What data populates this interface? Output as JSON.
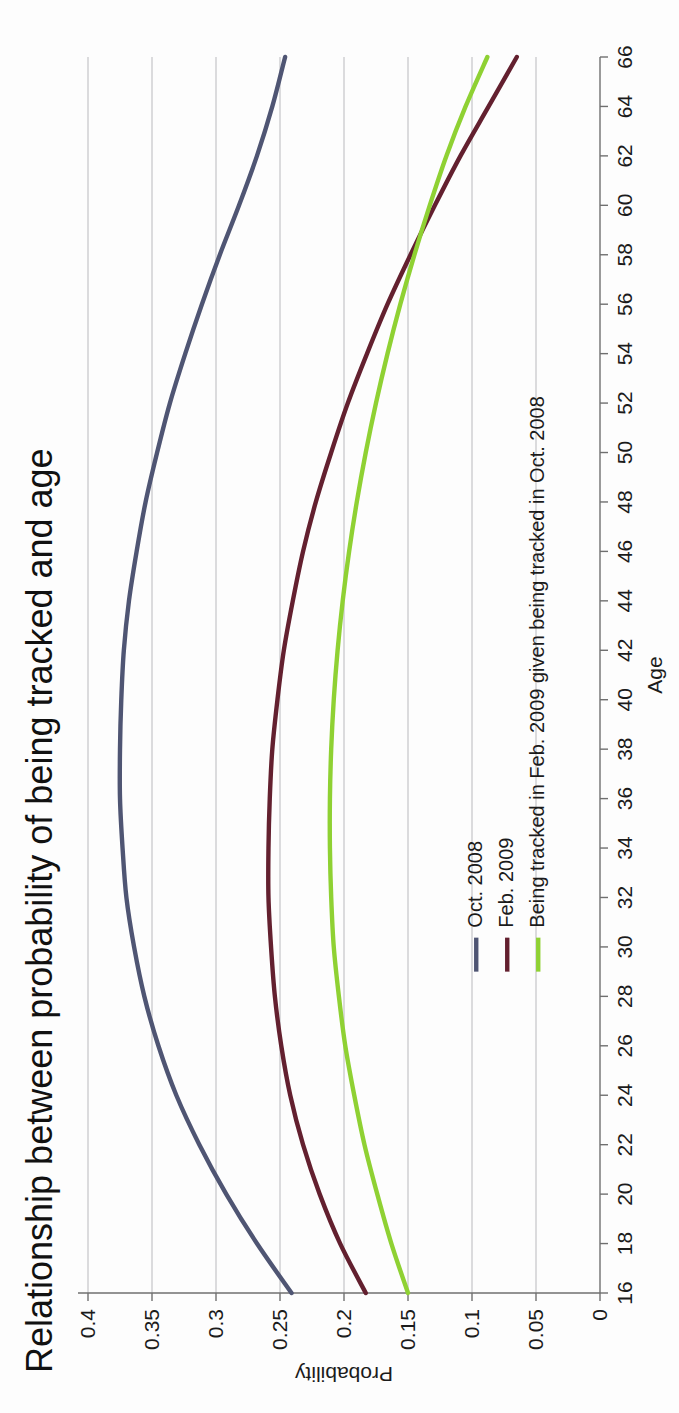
{
  "document": {
    "kind": "scanned-chart-page",
    "orientation": "rotated-90-ccw"
  },
  "chart_data": {
    "type": "line",
    "title": "Relationship between probability of being tracked and age",
    "xlabel": "Age",
    "ylabel": "Probability",
    "xlim": [
      16,
      66
    ],
    "ylim": [
      0,
      0.4
    ],
    "grid": true,
    "legend_position": "inside-left",
    "x_ticks": [
      16,
      18,
      20,
      22,
      24,
      26,
      28,
      30,
      32,
      34,
      36,
      38,
      40,
      42,
      44,
      46,
      48,
      50,
      52,
      54,
      56,
      58,
      60,
      62,
      64,
      66
    ],
    "y_ticks": [
      0,
      0.05,
      0.1,
      0.15,
      0.2,
      0.25,
      0.3,
      0.35,
      0.4
    ],
    "y_tick_labels": [
      "0",
      "0.05",
      "0.1",
      "0.15",
      "0.2",
      "0.25",
      "0.3",
      "0.35",
      "0.4"
    ],
    "x": [
      16,
      18,
      20,
      22,
      24,
      26,
      28,
      30,
      32,
      34,
      36,
      38,
      40,
      42,
      44,
      46,
      48,
      50,
      52,
      54,
      56,
      58,
      60,
      62,
      64,
      66
    ],
    "series": [
      {
        "name": "Oct. 2008",
        "color": "#4f5573",
        "values": [
          0.241,
          0.268,
          0.292,
          0.313,
          0.331,
          0.345,
          0.356,
          0.364,
          0.37,
          0.373,
          0.375,
          0.375,
          0.374,
          0.372,
          0.368,
          0.362,
          0.355,
          0.346,
          0.336,
          0.324,
          0.311,
          0.297,
          0.282,
          0.268,
          0.256,
          0.246
        ]
      },
      {
        "name": "Feb. 2009",
        "color": "#63202f",
        "values": [
          0.183,
          0.203,
          0.219,
          0.232,
          0.242,
          0.249,
          0.254,
          0.257,
          0.259,
          0.259,
          0.258,
          0.256,
          0.252,
          0.247,
          0.24,
          0.232,
          0.222,
          0.21,
          0.197,
          0.182,
          0.166,
          0.148,
          0.129,
          0.109,
          0.087,
          0.065
        ]
      },
      {
        "name": "Being tracked in Feb. 2009 given being tracked in Oct. 2008",
        "color": "#8fd133",
        "values": [
          0.15,
          0.163,
          0.174,
          0.184,
          0.192,
          0.199,
          0.204,
          0.208,
          0.21,
          0.211,
          0.211,
          0.21,
          0.208,
          0.205,
          0.201,
          0.196,
          0.19,
          0.183,
          0.175,
          0.166,
          0.156,
          0.145,
          0.133,
          0.12,
          0.105,
          0.088
        ]
      }
    ]
  },
  "legend": {
    "items": [
      {
        "label": "Oct. 2008",
        "color": "#4f5573"
      },
      {
        "label": "Feb. 2009",
        "color": "#63202f"
      },
      {
        "label": "Being tracked in Feb. 2009 given being tracked in Oct. 2008",
        "color": "#8fd133"
      }
    ]
  },
  "colors": {
    "series_oct_2008": "#4f5573",
    "series_feb_2009": "#63202f",
    "series_conditional": "#8fd133",
    "gridline": "#b9b9bd",
    "axis": "#6f6f6f",
    "text": "#1b1b1b",
    "page_background": "#fdfdfd"
  }
}
